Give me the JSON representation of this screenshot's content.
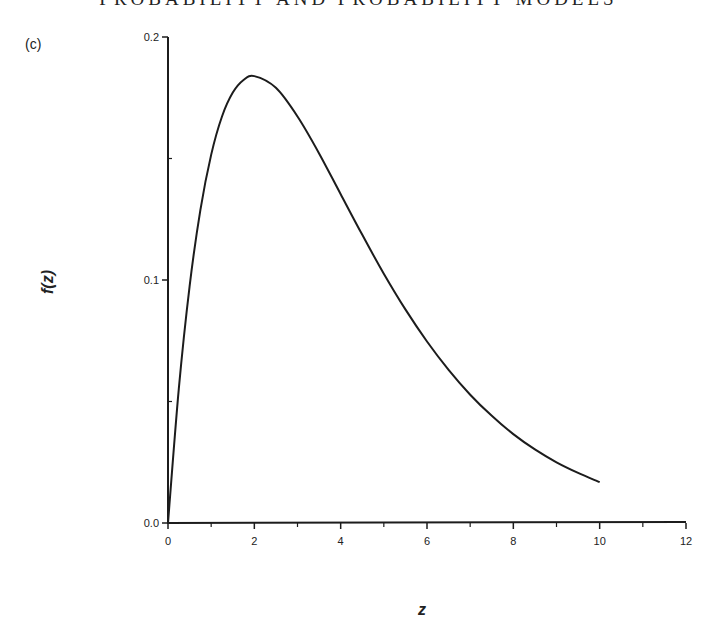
{
  "page": {
    "running_head": "PROBABILITY AND PROBABILITY MODELS",
    "panel_label": "(c)"
  },
  "chart_data": {
    "type": "line",
    "title": "",
    "xlabel": "z",
    "ylabel": "f(z)",
    "xlim": [
      0,
      12
    ],
    "ylim": [
      0,
      0.2
    ],
    "x_ticks": [
      0,
      2,
      4,
      6,
      8,
      10,
      12
    ],
    "x_tick_labels": [
      "0",
      "2",
      "4",
      "6",
      "8",
      "10",
      "12"
    ],
    "x_minor_ticks": [
      1,
      3,
      5,
      7,
      9,
      11
    ],
    "y_ticks": [
      0.0,
      0.1,
      0.2
    ],
    "y_tick_labels": [
      "0.0",
      "0.1",
      "0.2"
    ],
    "y_minor_ticks": [
      0.05,
      0.15
    ],
    "grid": false,
    "legend": null,
    "series": [
      {
        "name": "f(z)",
        "description": "Right-skewed density, peak ~0.184 at z=2 (consistent with z·e^(-z/2)/4)",
        "x": [
          0,
          0.25,
          0.5,
          0.75,
          1,
          1.25,
          1.5,
          1.75,
          2,
          2.5,
          3,
          3.5,
          4,
          4.5,
          5,
          5.5,
          6,
          6.5,
          7,
          7.5,
          8,
          8.5,
          9,
          9.5,
          10
        ],
        "y": [
          0,
          0.0552,
          0.0974,
          0.1289,
          0.1516,
          0.1673,
          0.1771,
          0.1823,
          0.1839,
          0.1791,
          0.1673,
          0.1521,
          0.1353,
          0.1186,
          0.1026,
          0.0879,
          0.0747,
          0.063,
          0.0528,
          0.0441,
          0.0366,
          0.0303,
          0.025,
          0.0206,
          0.0168
        ]
      }
    ]
  }
}
